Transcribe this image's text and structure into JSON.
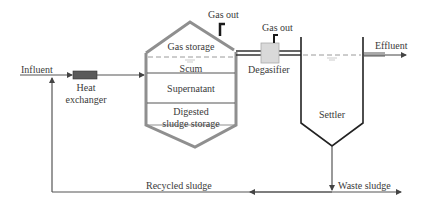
{
  "diagram": {
    "labels": {
      "influent": "Influent",
      "heat_exchanger_line1": "Heat",
      "heat_exchanger_line2": "exchanger",
      "gas_out_digester": "Gas out",
      "gas_out_degasifier": "Gas out",
      "gas_storage": "Gas storage",
      "scum": "Scum",
      "supernatant": "Supernatant",
      "digested_line1": "Digested",
      "digested_line2": "sludge storage",
      "degasifier": "Degasifier",
      "effluent": "Effluent",
      "settler": "Settler",
      "recycled_sludge": "Recycled sludge",
      "waste_sludge": "Waste sludge"
    },
    "colors": {
      "digester_outline": "#8f8f8f",
      "pipe": "#555555",
      "dark_pipe": "#1a1a1a",
      "heat_exchanger": "#555555",
      "degasifier_fill": "#d9d9d9",
      "dashed_level": "#9a9a9a",
      "text": "#3a3a3a"
    }
  }
}
